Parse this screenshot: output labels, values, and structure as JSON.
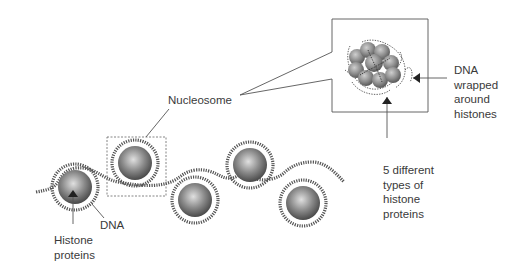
{
  "labels": {
    "nucleosome": "Nucleosome",
    "dna_wrapped_1": "DNA",
    "dna_wrapped_2": "wrapped",
    "dna_wrapped_3": "around",
    "dna_wrapped_4": "histones",
    "five_types_1": "5 different",
    "five_types_2": "types of",
    "five_types_3": "histone",
    "five_types_4": "proteins",
    "dna": "DNA",
    "histone_1": "Histone",
    "histone_2": "proteins"
  },
  "colors": {
    "line": "#444444",
    "sphere_light": "#d8d8d8",
    "sphere_dark": "#555555",
    "text": "#3a3a3a"
  }
}
